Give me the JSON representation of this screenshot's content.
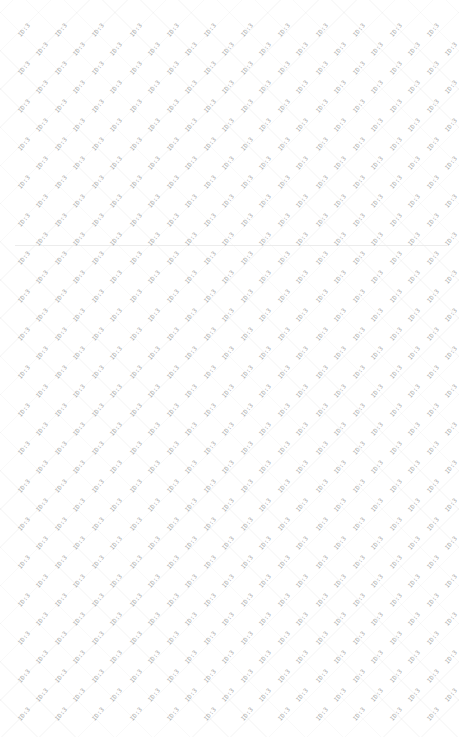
{
  "page": {
    "background": "#ffffff",
    "width": 459,
    "height": 737
  },
  "watermark": {
    "text": "ID:3",
    "color": "#9a9a9a",
    "rotation_deg": -50,
    "grid": {
      "start_x": 24,
      "start_y": 30,
      "step_x": 37.2,
      "step_y": 19,
      "odd_row_offset_x": 18,
      "rows": 37,
      "cols": 12
    }
  },
  "divider": {
    "y": 245,
    "color": "#ececec"
  }
}
